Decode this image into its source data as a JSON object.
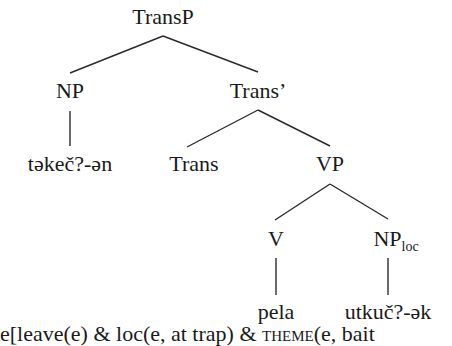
{
  "tree": {
    "root": "TransP",
    "np_subject": "NP",
    "np_subject_word": "tәkeč?-әn",
    "trans_bar": "Trans’",
    "trans_head": "Trans",
    "vp": "VP",
    "v": "V",
    "v_word": "pela",
    "np_loc": "NP",
    "np_loc_subscript": "loc",
    "np_loc_word": "utkuč?-әk"
  },
  "formula": {
    "part1": "e[leave(e) & loc(e, at trap) & ",
    "theme": "theme",
    "part2": "(e, bait"
  },
  "style": {
    "ink": "#1a1a1a",
    "background": "#ffffff"
  }
}
